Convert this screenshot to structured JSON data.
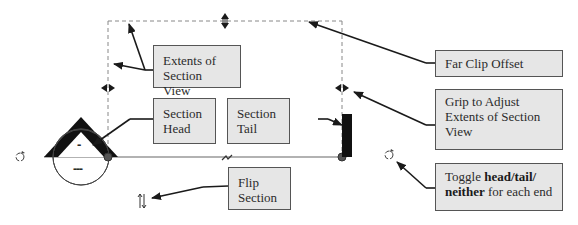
{
  "callouts": {
    "extents": {
      "line1": "Extents of",
      "line2": "Section View"
    },
    "head": {
      "line1": "Section",
      "line2": "Head"
    },
    "tail": {
      "line1": "Section",
      "line2": "Tail"
    },
    "far_clip": {
      "text": "Far Clip Offset"
    },
    "grip": {
      "line1": "Grip to Adjust",
      "line2": "Extents of Section",
      "line3": "View"
    },
    "toggle": {
      "pre": "Toggle ",
      "head": "head",
      "sep1": "/",
      "tail": "tail",
      "sep2": "/",
      "neither": "neither",
      "post": " for each end"
    },
    "flip": {
      "line1": "Flip",
      "line2": "Section"
    }
  },
  "section_head": {
    "upper_label": "-",
    "lower_label": "---"
  },
  "icons": [
    "cycle-icon-left",
    "cycle-icon-right",
    "flip-icon",
    "break-icon"
  ],
  "colors": {
    "callout_bg": "#e6e6e6",
    "callout_border": "#555555",
    "grip": "#1a1a1a",
    "endpoint": "#555555"
  }
}
